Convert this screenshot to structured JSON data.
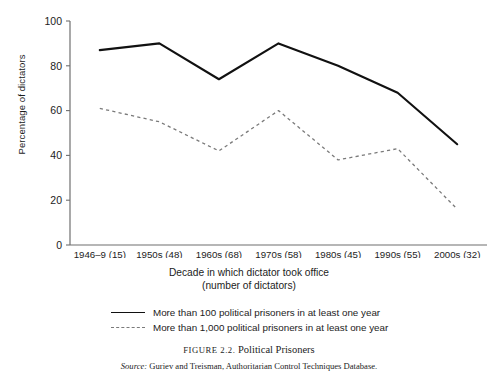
{
  "chart_data": {
    "type": "line",
    "title": "Political Prisoners",
    "xlabel": "Decade in which dictator took office (number of dictators)",
    "ylabel": "Percentage of dictators",
    "categories": [
      "1946–9 (15)",
      "1950s (48)",
      "1960s (68)",
      "1970s (58)",
      "1980s (45)",
      "1990s (55)",
      "2000s (32)"
    ],
    "ylim": [
      0,
      100
    ],
    "yticks": [
      0,
      20,
      40,
      60,
      80,
      100
    ],
    "grid": false,
    "legend_position": "below-plot",
    "series": [
      {
        "name": "More than 100 political prisoners in at least one year",
        "style": "solid",
        "color": "#111111",
        "values": [
          87,
          90,
          74,
          90,
          80,
          68,
          45
        ]
      },
      {
        "name": "More than 1,000 political prisoners in at least one year",
        "style": "dashed",
        "color": "#7a7a7a",
        "values": [
          61,
          55,
          42,
          60,
          38,
          43,
          16
        ]
      }
    ]
  },
  "axes": {
    "y_title": "Percentage of dictators",
    "x_title_line1": "Decade in which dictator took office",
    "x_title_line2": "(number of dictators)",
    "y_tick_labels": [
      "100",
      "80",
      "60",
      "40",
      "20",
      "0"
    ],
    "x_tick_labels": [
      "1946–9 (15)",
      "1950s (48)",
      "1960s (68)",
      "1970s (58)",
      "1980s (45)",
      "1990s (55)",
      "2000s (32)"
    ]
  },
  "legend": {
    "items": [
      {
        "label": "More than 100 political prisoners in at least one year",
        "style": "solid"
      },
      {
        "label": "More than 1,000 political prisoners in at least one year",
        "style": "dashed"
      }
    ]
  },
  "caption": {
    "figure_number": "FIGURE 2.2.",
    "title": "Political Prisoners",
    "source_label": "Source:",
    "source_text": "Guriev and Treisman, Authoritarian Control Techniques Database."
  }
}
